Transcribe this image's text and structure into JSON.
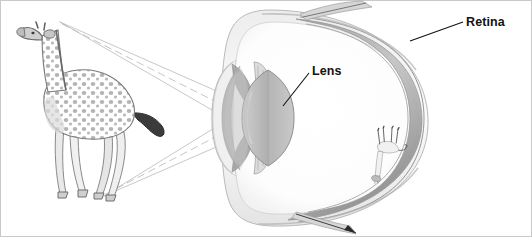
{
  "figure": {
    "caption": "",
    "background_color": "#ffffff",
    "border_color": "#c9c9c9",
    "style": "pencil-sketch-diagram"
  },
  "labels": [
    {
      "id": "retina",
      "text": "Retina",
      "color": "#14120f",
      "leader_from": [
        410,
        41
      ],
      "leader_to": [
        463,
        22
      ]
    },
    {
      "id": "lens",
      "text": "Lens",
      "color": "#14120f",
      "leader_from": [
        283,
        106
      ],
      "leader_to": [
        309,
        73
      ]
    }
  ],
  "objects": {
    "subject": {
      "name": "giraffe",
      "position": "left",
      "orientation": "upright",
      "description": "pencil drawing of a standing giraffe facing left"
    },
    "eye": {
      "name": "eyeball",
      "position": "right",
      "parts": [
        "cornea",
        "lens",
        "ciliary-body",
        "retina",
        "sclera",
        "optic-nerve"
      ]
    },
    "retinal_image": {
      "name": "giraffe-inverted",
      "position": "on-retina",
      "orientation": "inverted",
      "description": "small inverted pencil drawing of the giraffe projected on the retina"
    }
  },
  "light_rays": {
    "count": 6,
    "color": "#a8a8a8",
    "dashed_color": "#b4b4b4",
    "from_head": [
      60,
      22
    ],
    "from_feet": [
      104,
      196
    ],
    "lens_center": [
      268,
      118
    ],
    "image_top": [
      398,
      148
    ],
    "image_bottom": [
      392,
      74
    ]
  },
  "colors": {
    "ink": "#14120f",
    "pencil_light": "#d8d8d8",
    "pencil_mid": "#aaaaaa",
    "pencil_dark": "#6e6e6e",
    "lens_fill": "#bfbfbf",
    "sclera_fill": "#f4f4f4"
  }
}
